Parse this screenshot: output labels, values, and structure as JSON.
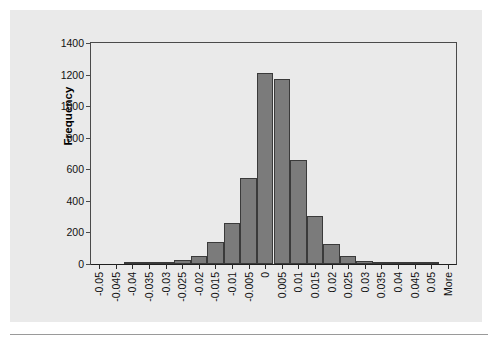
{
  "chart_data": {
    "type": "bar",
    "title": "",
    "subtitle": "",
    "xlabel": "",
    "ylabel": "Frequency",
    "ylim": [
      0,
      1400
    ],
    "y_ticks": [
      0,
      200,
      400,
      600,
      800,
      1000,
      1200,
      1400
    ],
    "grid": false,
    "legend": null,
    "bar_color": "#7b7b7b",
    "bar_border_color": "#3a3a3a",
    "plot_background": "#eaeaea",
    "axis_color": "#4a4a4a",
    "categories": [
      "-0.05",
      "-0.045",
      "-0.04",
      "-0.035",
      "-0.03",
      "-0.025",
      "-0.02",
      "-0.015",
      "-0.01",
      "-0.005",
      "0",
      "0.005",
      "0.01",
      "0.015",
      "0.02",
      "0.025",
      "0.03",
      "0.035",
      "0.04",
      "0.045",
      "0.05",
      "More"
    ],
    "values": [
      0,
      0,
      2,
      3,
      12,
      25,
      52,
      140,
      260,
      545,
      1210,
      1175,
      660,
      305,
      125,
      50,
      20,
      8,
      5,
      2,
      2,
      0
    ]
  }
}
